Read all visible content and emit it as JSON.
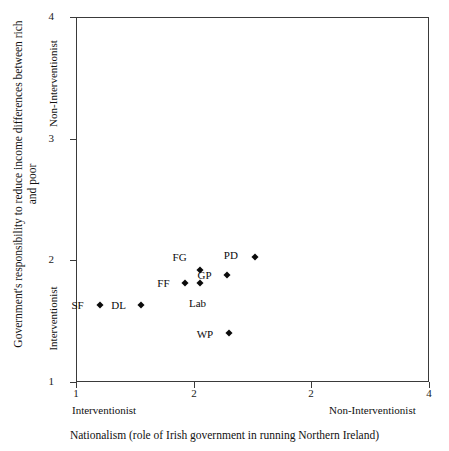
{
  "chart_data": {
    "type": "scatter",
    "title": "",
    "xlabel": "Nationalism (role of Irish government in running Northern Ireland)",
    "ylabel": "Government's responsibility to reduce income differences between rich and poor",
    "xlim": [
      1,
      4
    ],
    "ylim": [
      1,
      4
    ],
    "grid": false,
    "legend": "none",
    "x_tick_labels": [
      "1",
      "2",
      "2",
      "4"
    ],
    "y_tick_labels": [
      "1",
      "2",
      "3",
      "4"
    ],
    "x_axis_anchor_left": "Interventionist",
    "x_axis_anchor_right": "Non-Interventionist",
    "y_axis_anchor_low": "Interventionist",
    "y_axis_anchor_high": "Non-Interventionist",
    "points": [
      {
        "label": "SF",
        "x": 1.2,
        "y": 1.63,
        "label_dx": -22,
        "label_dy": 0
      },
      {
        "label": "DL",
        "x": 1.55,
        "y": 1.63,
        "label_dx": -22,
        "label_dy": 0
      },
      {
        "label": "FF",
        "x": 1.93,
        "y": 1.81,
        "label_dx": -22,
        "label_dy": 0
      },
      {
        "label": "Lab",
        "x": 2.05,
        "y": 1.81,
        "label_dx": -2,
        "label_dy": 20
      },
      {
        "label": "FG",
        "x": 2.05,
        "y": 1.92,
        "label_dx": -20,
        "label_dy": -13
      },
      {
        "label": "GP",
        "x": 2.28,
        "y": 1.88,
        "label_dx": -22,
        "label_dy": 0
      },
      {
        "label": "PD",
        "x": 2.52,
        "y": 2.03,
        "label_dx": -24,
        "label_dy": -2
      },
      {
        "label": "WP",
        "x": 2.3,
        "y": 1.4,
        "label_dx": -24,
        "label_dy": 1
      }
    ]
  }
}
